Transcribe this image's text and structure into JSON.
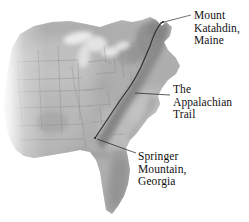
{
  "figure": {
    "kind": "relief-map",
    "region": "Eastern United States",
    "background_color": "#ffffff",
    "width": 249,
    "height": 222
  },
  "map": {
    "style": "grayscale shaded relief",
    "land_color": "#a9a9a9",
    "land_light_color": "#cfcfcf",
    "highland_color": "#8e8e8e",
    "lowland_color": "#bdbdbd",
    "water_color": "#f2f2f2",
    "border_color": "#8a8a8a",
    "fade_edge": "west",
    "state_borders_visible": true
  },
  "trail": {
    "name": "Appalachian Trail",
    "color": "#2e2e2e",
    "stroke_width": 1.1,
    "north_terminus": "Mount Katahdin, Maine",
    "south_terminus": "Springer Mountain, Georgia"
  },
  "labels": [
    {
      "id": "katahdin",
      "lines": [
        "Mount",
        "Katahdin,",
        "Maine"
      ],
      "leader_color": "#1a1a1a"
    },
    {
      "id": "trail",
      "lines": [
        "The",
        "Appalachian",
        "Trail"
      ],
      "leader_color": "#1a1a1a"
    },
    {
      "id": "springer",
      "lines": [
        "Springer",
        "Mountain,",
        "Georgia"
      ],
      "leader_color": "#1a1a1a"
    }
  ]
}
